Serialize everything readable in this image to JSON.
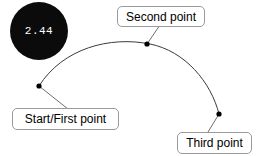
{
  "canvas": {
    "width": 259,
    "height": 156,
    "background": "#ffffff"
  },
  "badge": {
    "name": "value-badge",
    "value": "2.44",
    "fill": "#0b0b0b",
    "text_color": "#ffffff",
    "cx": 39,
    "cy": 31,
    "r": 29
  },
  "curve": {
    "name": "arc-path",
    "stroke": "#3b3b3b",
    "stroke_width": 1,
    "path": "M 39 86 C 63 48, 110 36, 150 44 C 185 51, 211 82, 219 114"
  },
  "points": [
    {
      "id": "start",
      "name": "start-point-marker",
      "x": 39,
      "y": 86,
      "r": 2.6,
      "color": "#000000"
    },
    {
      "id": "second",
      "name": "second-point-marker",
      "x": 147,
      "y": 44,
      "r": 2.6,
      "color": "#000000"
    },
    {
      "id": "third",
      "name": "third-point-marker",
      "x": 219,
      "y": 114,
      "r": 2.6,
      "color": "#000000"
    }
  ],
  "leaders": [
    {
      "name": "start-point-leader-line",
      "x1": 39,
      "y1": 86,
      "x2": 68,
      "y2": 109,
      "stroke": "#6e6e6e"
    },
    {
      "name": "second-point-leader-line",
      "x1": 147,
      "y1": 44,
      "x2": 160,
      "y2": 25,
      "stroke": "#6e6e6e"
    },
    {
      "name": "third-point-leader-line",
      "x1": 219,
      "y1": 114,
      "x2": 208,
      "y2": 132,
      "stroke": "#6e6e6e"
    }
  ],
  "labels": {
    "start": {
      "name": "start-point-label",
      "text": "Start/First point",
      "left": 12,
      "top": 108,
      "width": 107,
      "height": 22
    },
    "second": {
      "name": "second-point-label",
      "text": "Second point",
      "left": 117,
      "top": 6,
      "width": 88,
      "height": 21
    },
    "third": {
      "name": "third-point-label",
      "text": "Third point",
      "left": 177,
      "top": 132,
      "width": 75,
      "height": 22
    }
  }
}
